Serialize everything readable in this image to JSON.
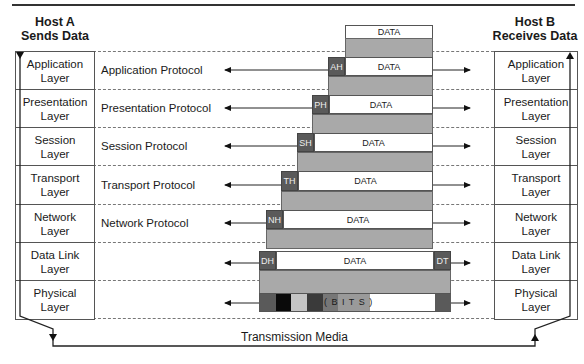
{
  "diagram": {
    "host_a": {
      "line1": "Host A",
      "line2": "Sends Data"
    },
    "host_b": {
      "line1": "Host B",
      "line2": "Receives Data"
    },
    "layers": [
      {
        "line1": "Application",
        "line2": "Layer",
        "protocol": "Application Protocol",
        "header": "AH",
        "data": "DATA"
      },
      {
        "line1": "Presentation",
        "line2": "Layer",
        "protocol": "Presentation Protocol",
        "header": "PH",
        "data": "DATA"
      },
      {
        "line1": "Session",
        "line2": "Layer",
        "protocol": "Session Protocol",
        "header": "SH",
        "data": "DATA"
      },
      {
        "line1": "Transport",
        "line2": "Layer",
        "protocol": "Transport Protocol",
        "header": "TH",
        "data": "DATA"
      },
      {
        "line1": "Network",
        "line2": "Layer",
        "protocol": "Network Protocol",
        "header": "NH",
        "data": "DATA"
      },
      {
        "line1": "Data Link",
        "line2": "Layer",
        "protocol": "",
        "header": "DH",
        "data": "DATA",
        "trailer": "DT"
      },
      {
        "line1": "Physical",
        "line2": "Layer",
        "protocol": "",
        "data": "( B I T S )"
      }
    ],
    "top_data": "DATA",
    "transmission_media": "Transmission Media",
    "colors": {
      "header_fill": "#5a5a5a",
      "encap_gray": "#a9a9a9",
      "line": "#222222"
    }
  }
}
